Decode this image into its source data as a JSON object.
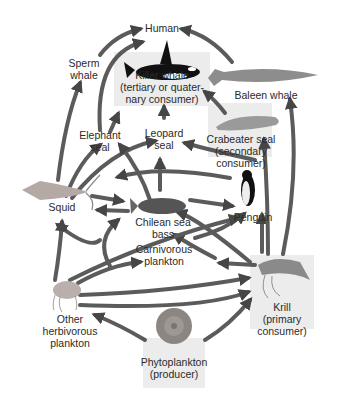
{
  "diagram": {
    "colors": {
      "arrow": "#3a3a3a",
      "highlight_box": "#ececec",
      "text": "#2a2a2a",
      "background": "#ffffff"
    },
    "nodes": [
      {
        "id": "human",
        "label": "Human",
        "highlight": false
      },
      {
        "id": "sperm_whale",
        "label": "Sperm\nwhale",
        "highlight": false
      },
      {
        "id": "killer_whale",
        "label": "Killer whale\n(tertiary or quater-\nnary consumer)",
        "highlight": true
      },
      {
        "id": "baleen_whale",
        "label": "Baleen whale",
        "highlight": false
      },
      {
        "id": "elephant_seal",
        "label": "Elephant\nseal",
        "highlight": false
      },
      {
        "id": "leopard_seal",
        "label": "Leopard\nseal",
        "highlight": false
      },
      {
        "id": "crabeater_seal",
        "label": "Crabeater seal\n(secondary\nconsumer)",
        "highlight": true
      },
      {
        "id": "squid",
        "label": "Squid",
        "highlight": false
      },
      {
        "id": "chilean_sea_bass",
        "label": "Chilean sea\nbass",
        "highlight": false
      },
      {
        "id": "penguin",
        "label": "Penguin",
        "highlight": false
      },
      {
        "id": "carnivorous_plankton",
        "label": "Carnivorous\nplankton",
        "highlight": false
      },
      {
        "id": "other_herbivorous_plankton",
        "label": "Other\nherbivorous\nplankton",
        "highlight": false
      },
      {
        "id": "krill",
        "label": "Krill\n(primary\nconsumer)",
        "highlight": true
      },
      {
        "id": "phytoplankton",
        "label": "Phytoplankton\n(producer)",
        "highlight": true
      }
    ],
    "edges": [
      [
        "sperm_whale",
        "human"
      ],
      [
        "elephant_seal",
        "killer_whale"
      ],
      [
        "killer_whale",
        "human"
      ],
      [
        "baleen_whale",
        "human"
      ],
      [
        "leopard_seal",
        "killer_whale"
      ],
      [
        "crabeater_seal",
        "killer_whale"
      ],
      [
        "squid",
        "sperm_whale"
      ],
      [
        "squid",
        "elephant_seal"
      ],
      [
        "squid",
        "leopard_seal"
      ],
      [
        "squid",
        "killer_whale"
      ],
      [
        "squid",
        "chilean_sea_bass"
      ],
      [
        "chilean_sea_bass",
        "squid"
      ],
      [
        "chilean_sea_bass",
        "elephant_seal"
      ],
      [
        "chilean_sea_bass",
        "leopard_seal"
      ],
      [
        "chilean_sea_bass",
        "penguin"
      ],
      [
        "penguin",
        "leopard_seal"
      ],
      [
        "penguin",
        "squid"
      ],
      [
        "krill",
        "crabeater_seal"
      ],
      [
        "krill",
        "baleen_whale"
      ],
      [
        "krill",
        "penguin"
      ],
      [
        "krill",
        "leopard_seal"
      ],
      [
        "krill",
        "chilean_sea_bass"
      ],
      [
        "krill",
        "squid"
      ],
      [
        "krill",
        "carnivorous_plankton"
      ],
      [
        "carnivorous_plankton",
        "squid"
      ],
      [
        "carnivorous_plankton",
        "penguin"
      ],
      [
        "carnivorous_plankton",
        "chilean_sea_bass"
      ],
      [
        "other_herbivorous_plankton",
        "squid"
      ],
      [
        "other_herbivorous_plankton",
        "carnivorous_plankton"
      ],
      [
        "other_herbivorous_plankton",
        "penguin"
      ],
      [
        "other_herbivorous_plankton",
        "krill"
      ],
      [
        "phytoplankton",
        "other_herbivorous_plankton"
      ],
      [
        "phytoplankton",
        "krill"
      ]
    ]
  }
}
